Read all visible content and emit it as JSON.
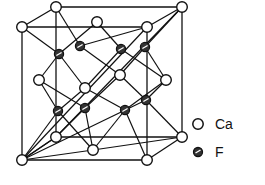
{
  "figure": {
    "colors": {
      "line": "#111111",
      "ca_fill": "#ffffff",
      "f_fill": "#333333",
      "background": "#ffffff"
    }
  },
  "legend": {
    "items": [
      {
        "symbol": "open-circle",
        "label": "Ca"
      },
      {
        "symbol": "hatched-circle",
        "label": "F"
      }
    ]
  },
  "atoms": {
    "ca": [
      [
        56,
        7
      ],
      [
        182,
        7
      ],
      [
        22,
        27
      ],
      [
        147,
        27
      ],
      [
        97,
        22
      ],
      [
        39,
        80
      ],
      [
        166,
        80
      ],
      [
        85,
        88
      ],
      [
        120,
        75
      ],
      [
        56,
        137
      ],
      [
        182,
        137
      ],
      [
        22,
        160
      ],
      [
        147,
        160
      ],
      [
        93,
        150
      ]
    ],
    "f": [
      [
        59,
        54
      ],
      [
        80,
        46
      ],
      [
        121,
        49
      ],
      [
        145,
        47
      ],
      [
        58,
        111
      ],
      [
        85,
        108
      ],
      [
        125,
        110
      ],
      [
        146,
        100
      ]
    ]
  }
}
